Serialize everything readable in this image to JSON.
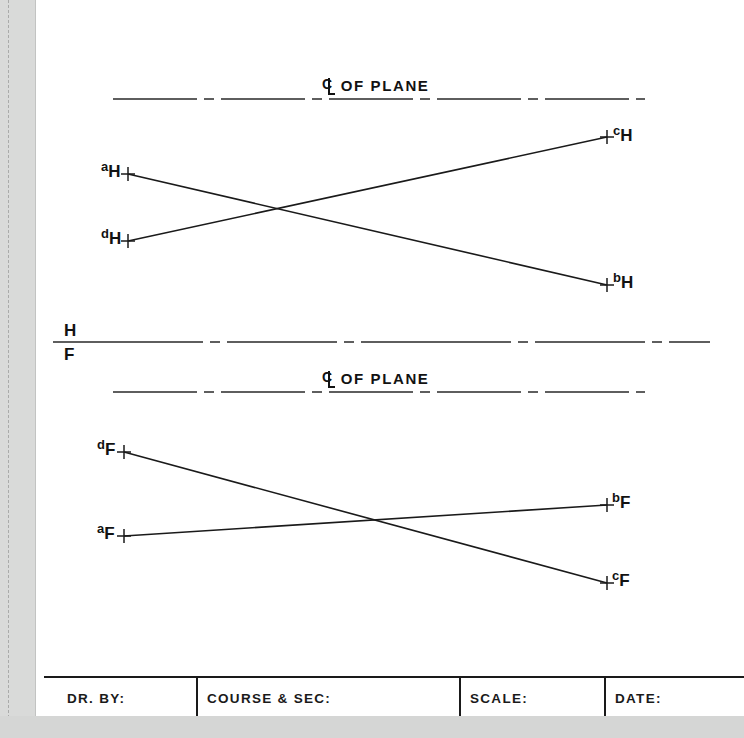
{
  "drawing": {
    "title_top": {
      "symbol": "centerline-symbol",
      "text": "OF PLANE"
    },
    "title_bottom": {
      "symbol": "centerline-symbol",
      "text": "OF PLANE"
    },
    "fold_line": {
      "upper_letter": "H",
      "lower_letter": "F"
    },
    "horizontal_view": {
      "name": "H",
      "points": [
        {
          "id": "a-h",
          "letter": "a",
          "view": "H",
          "x": 128,
          "y": 174,
          "label_x": 101,
          "label_y": 160
        },
        {
          "id": "d-h",
          "letter": "d",
          "view": "H",
          "x": 128,
          "y": 241,
          "label_x": 101,
          "label_y": 227
        },
        {
          "id": "c-h",
          "letter": "c",
          "view": "H",
          "x": 607,
          "y": 137,
          "label_x": 613,
          "label_y": 124
        },
        {
          "id": "b-h",
          "letter": "b",
          "view": "H",
          "x": 607,
          "y": 285,
          "label_x": 613,
          "label_y": 271
        }
      ],
      "lines": [
        {
          "id": "line-a-b",
          "from": "a-h",
          "to": "b-h"
        },
        {
          "id": "line-d-c",
          "from": "d-h",
          "to": "c-h"
        }
      ]
    },
    "frontal_view": {
      "name": "F",
      "points": [
        {
          "id": "d-f",
          "letter": "d",
          "view": "F",
          "x": 124,
          "y": 452,
          "label_x": 97,
          "label_y": 438
        },
        {
          "id": "a-f",
          "letter": "a",
          "view": "F",
          "x": 124,
          "y": 536,
          "label_x": 97,
          "label_y": 522
        },
        {
          "id": "b-f",
          "letter": "b",
          "view": "F",
          "x": 607,
          "y": 505,
          "label_x": 612,
          "label_y": 491
        },
        {
          "id": "c-f",
          "letter": "c",
          "view": "F",
          "x": 607,
          "y": 583,
          "label_x": 612,
          "label_y": 569
        }
      ],
      "lines": [
        {
          "id": "line-d-c-f",
          "from": "d-f",
          "to": "c-f"
        },
        {
          "id": "line-a-b-f",
          "from": "a-f",
          "to": "b-f"
        }
      ]
    },
    "colors": {
      "ink": "#121212",
      "line": "#1a1a1a",
      "paper": "#ffffff",
      "scan_edge": "#d9dad9"
    }
  },
  "title_block": {
    "fields": [
      {
        "id": "drawn-by",
        "label": "DR. BY:",
        "value": ""
      },
      {
        "id": "course-sec",
        "label": "COURSE & SEC:",
        "value": ""
      },
      {
        "id": "scale",
        "label": "SCALE:",
        "value": ""
      },
      {
        "id": "date",
        "label": "DATE:",
        "value": ""
      }
    ]
  }
}
